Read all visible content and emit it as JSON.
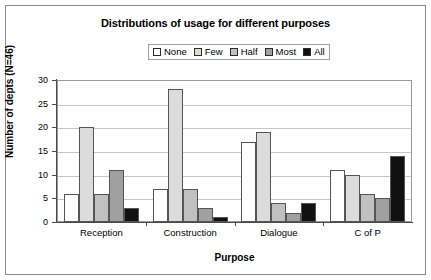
{
  "chart_data": {
    "type": "bar",
    "title": "Distributions of usage for different purposes",
    "xlabel": "Purpose",
    "ylabel": "Number of depts (N=46)",
    "categories": [
      "Reception",
      "Construction",
      "Dialogue",
      "C of P"
    ],
    "series": [
      {
        "name": "None",
        "values": [
          6,
          7,
          17,
          11
        ],
        "color": "#ffffff"
      },
      {
        "name": "Few",
        "values": [
          20,
          28,
          19,
          10
        ],
        "color": "#dcdcdc"
      },
      {
        "name": "Half",
        "values": [
          6,
          7,
          4,
          6
        ],
        "color": "#c0c0c0"
      },
      {
        "name": "Most",
        "values": [
          11,
          3,
          2,
          5
        ],
        "color": "#a0a0a0"
      },
      {
        "name": "All",
        "values": [
          3,
          1,
          4,
          14
        ],
        "color": "#111111"
      }
    ],
    "ylim": [
      0,
      30
    ],
    "yticks": [
      "0",
      "5",
      "10",
      "15",
      "20",
      "25",
      "30"
    ],
    "grid": true,
    "legend_position": "top-center"
  },
  "frame": {
    "border_color": "#8a8a8a",
    "background": "#ffffff"
  }
}
